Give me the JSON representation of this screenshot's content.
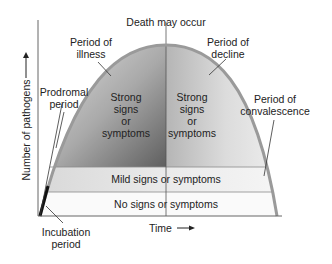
{
  "axes": {
    "y_label": "Number of pathogens",
    "x_label": "Time",
    "arrow": "→"
  },
  "labels": {
    "death": "Death may occur",
    "illness": [
      "Period of",
      "illness"
    ],
    "decline": [
      "Period of",
      "decline"
    ],
    "prodromal": [
      "Prodromal",
      "period"
    ],
    "convalescence": [
      "Period of",
      "convalescence"
    ],
    "incubation": [
      "Incubation",
      "period"
    ],
    "strong_left": [
      "Strong",
      "signs",
      "or",
      "symptoms"
    ],
    "strong_right": [
      "Strong",
      "signs",
      "or",
      "symptoms"
    ],
    "mild": "Mild signs or symptoms",
    "none": "No signs or symptoms"
  },
  "colors": {
    "curve": "#9a9a9a",
    "axis": "#555555",
    "text": "#222222",
    "band_light": "#f2f2f2",
    "shade_dark": "#6e6e6e"
  }
}
